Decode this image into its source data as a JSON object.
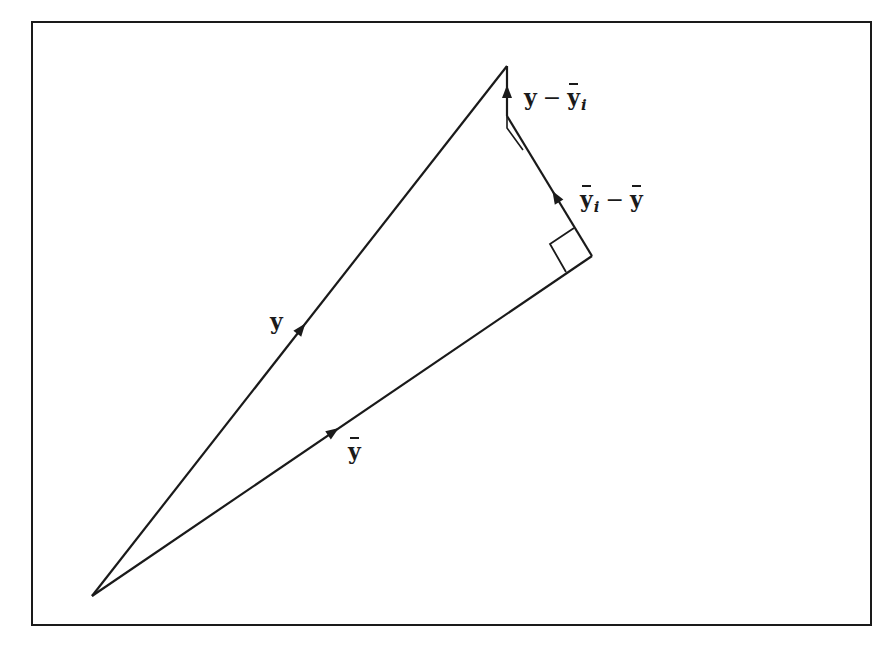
{
  "diagram": {
    "type": "vector-decomposition",
    "stroke_color": "#1a1a1a",
    "frame": {
      "x": 32,
      "y": 22,
      "width": 839,
      "height": 603
    },
    "points": {
      "origin": {
        "x": 92,
        "y": 596
      },
      "apex": {
        "x": 507,
        "y": 66
      },
      "corner": {
        "x": 592,
        "y": 256
      }
    },
    "vectors": [
      {
        "id": "y",
        "from": "origin",
        "to": "apex",
        "label": "y"
      },
      {
        "id": "ybar",
        "from": "origin",
        "to": "corner",
        "label": "ȳ"
      },
      {
        "id": "yi_minus_ybar",
        "from": "corner",
        "to": "segment_top",
        "label_main": "ȳ",
        "label_sub": "i",
        "label_op": "−",
        "label_tail": "ȳ"
      },
      {
        "id": "y_minus_yi",
        "from": "segment_top",
        "to": "apex",
        "label_main": "y",
        "label_op": "−",
        "label_tail": "ȳ",
        "label_tail_sub": "i"
      }
    ],
    "right_angle_marks": 2
  },
  "labels": {
    "y": "y",
    "ybar": "y",
    "yi_minus_ybar": {
      "a": "y",
      "a_sub": "i",
      "op": "−",
      "b": "y"
    },
    "y_minus_yi": {
      "a": "y",
      "op": "−",
      "b": "y",
      "b_sub": "i"
    }
  }
}
